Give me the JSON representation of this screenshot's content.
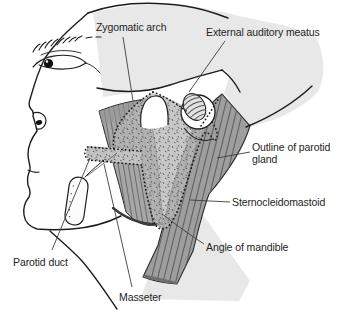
{
  "figure": {
    "type": "anatomical line diagram",
    "labels": {
      "zygomatic_arch": "Zygomatic arch",
      "external_auditory_meatus": "External auditory meatus",
      "outline_of_parotid_gland": "Outline of parotid gland",
      "sternocleidomastoid": "Sternocleidomastoid",
      "angle_of_mandible": "Angle of mandible",
      "parotid_duct": "Parotid duct",
      "masseter": "Masseter"
    },
    "colors": {
      "background": "#ffffff",
      "head_wash": "#e8e8e8",
      "muscle_fill": "#a2a2a2",
      "muscle_stripe": "#626262",
      "gland_fill": "#b7b7b7",
      "gland_stipple": "#4a4a4a",
      "outline": "#1c1c1c",
      "label_text": "#242424"
    }
  }
}
